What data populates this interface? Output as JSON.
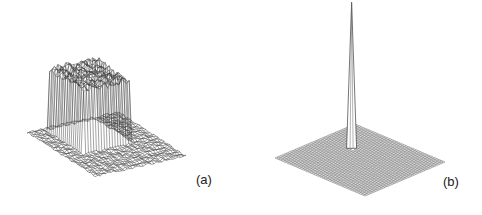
{
  "figures": [
    {
      "id": "a",
      "label": "(a)",
      "description": "3D wireframe surface plot of a noisy rectangular plateau (box function) on a flat noisy base grid"
    },
    {
      "id": "b",
      "label": "(b)",
      "description": "3D wireframe surface plot of a flat grid with a single sharp narrow peak (delta-like spike) near the center"
    }
  ],
  "colors": {
    "line": "#3a3a3a",
    "background": "#ffffff"
  }
}
